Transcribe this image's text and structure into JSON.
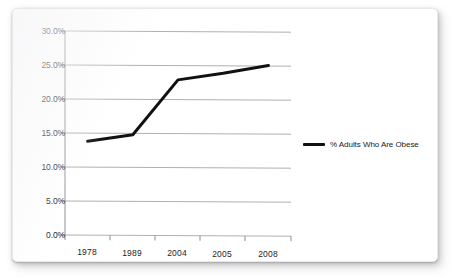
{
  "chart_data": {
    "type": "line",
    "title": "",
    "xlabel": "",
    "ylabel": "",
    "categories": [
      "1978",
      "1989",
      "2004",
      "2005",
      "2008"
    ],
    "series": [
      {
        "name": "% Adults Who Are Obese",
        "color": "#111111",
        "values": [
          13.8,
          14.8,
          22.9,
          23.9,
          25.1
        ]
      }
    ],
    "ylim": [
      0.0,
      30.0
    ],
    "y_ticks": [
      0.0,
      5.0,
      10.0,
      15.0,
      20.0,
      25.0,
      30.0
    ],
    "y_tick_labels": [
      "0.0%",
      "5.0%",
      "10.0%",
      "15.0%",
      "20.0%",
      "25.0%",
      "30.0%"
    ],
    "grid": true,
    "grid_axis": "y",
    "legend_position": "right",
    "legend_entries": [
      "% Adults Who Are Obese"
    ],
    "marker": "none",
    "line_width": 3
  },
  "axes": {
    "y_labels": [
      "30.0%",
      "25.0%",
      "20.0%",
      "15.0%",
      "10.0%",
      "5.0%",
      "0.0%"
    ],
    "x_labels": [
      "1978",
      "1989",
      "2004",
      "2005",
      "2008"
    ]
  },
  "legend": {
    "series_label": "% Adults Who Are Obese"
  },
  "colors": {
    "line": "#111111",
    "grid": "#9a9a9a",
    "axis": "#8e8e8e",
    "text": "#242424",
    "card": "#ffffff"
  }
}
